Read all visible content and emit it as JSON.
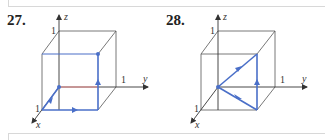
{
  "figures": [
    {
      "number": "27.",
      "axes": {
        "x": "x",
        "y": "y",
        "z": "z"
      },
      "ticks": {
        "x": "1",
        "y": "1",
        "z": "1"
      },
      "path_description": "Curve along cube edges from origin to (1,0,0), then to (1,1,0), then to (1,1,1); segment from origin to (0,1,0) highlighted red"
    },
    {
      "number": "28.",
      "axes": {
        "x": "x",
        "y": "y",
        "z": "z"
      },
      "ticks": {
        "x": "1",
        "y": "1",
        "z": "1"
      },
      "path_description": "Closed triangle from origin to (1,1,0), up to (1,1,1), back to origin"
    }
  ],
  "colors": {
    "path": "#4a6fc8",
    "highlight": "#e88a8a",
    "cube": "#555555",
    "axis": "#333333"
  }
}
